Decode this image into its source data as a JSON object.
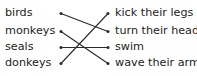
{
  "exercise": {
    "type": "matching-exercise",
    "left_column": {
      "items": [
        {
          "id": "birds",
          "label": "birds"
        },
        {
          "id": "monkeys",
          "label": "monkeys"
        },
        {
          "id": "seals",
          "label": "seals"
        },
        {
          "id": "donkeys",
          "label": "donkeys"
        }
      ]
    },
    "right_column": {
      "items": [
        {
          "id": "kick_their_legs",
          "label": "kick their legs"
        },
        {
          "id": "turn_their_heads",
          "label": "turn their heads"
        },
        {
          "id": "swim",
          "label": "swim"
        },
        {
          "id": "wave_their_arms",
          "label": "wave their arms"
        }
      ]
    },
    "connections": [
      {
        "from": "birds",
        "to": "turn_their_heads",
        "from_row": 1,
        "to_row": 2
      },
      {
        "from": "monkeys",
        "to": "wave_their_arms",
        "from_row": 2,
        "to_row": 4
      },
      {
        "from": "seals",
        "to": "swim",
        "from_row": 3,
        "to_row": 3
      },
      {
        "from": "donkeys",
        "to": "kick_their_legs",
        "from_row": 4,
        "to_row": 1
      }
    ],
    "colors": {
      "text": "#1d1d1d",
      "line": "#2b2b2b",
      "background": "#ffffff"
    }
  }
}
